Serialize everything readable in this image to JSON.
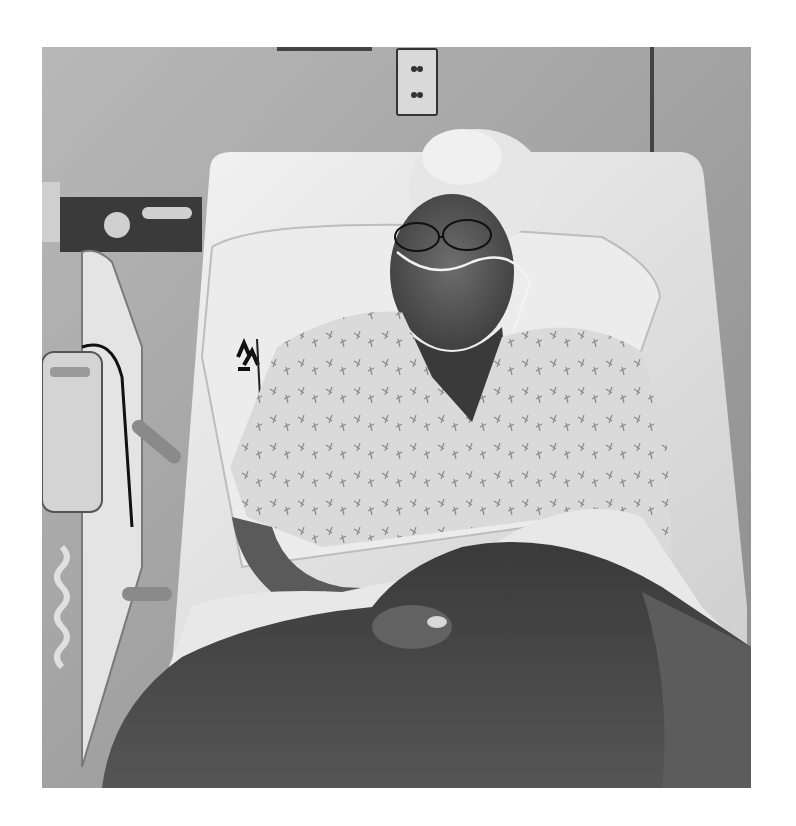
{
  "image": {
    "type": "photograph",
    "style": "black-and-white",
    "alt": "Elderly woman with curly white hair and glasses, wearing a nasal oxygen cannula and a printed hospital gown, reclining in a hospital bed under a dark knit blanket",
    "colors": {
      "border": "#ffffff",
      "wall": "#a8a8a8",
      "sheet": "#e6e6e6",
      "blanket": "#4a4a4a",
      "shadow": "#2e2e2e"
    }
  }
}
